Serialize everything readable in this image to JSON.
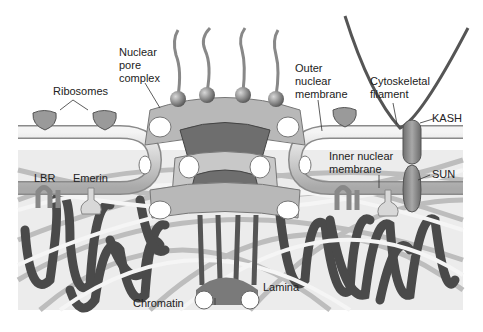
{
  "diagram": {
    "labels": {
      "ribosomes": "Ribosomes",
      "nuclear_pore_complex_1": "Nuclear",
      "nuclear_pore_complex_2": "pore",
      "nuclear_pore_complex_3": "complex",
      "outer_membrane_1": "Outer",
      "outer_membrane_2": "nuclear",
      "outer_membrane_3": "membrane",
      "cytoskeletal_1": "Cytoskeletal",
      "cytoskeletal_2": "filament",
      "kash": "KASH",
      "sun": "SUN",
      "inner_membrane_1": "Inner nuclear",
      "inner_membrane_2": "membrane",
      "lbr": "LBR",
      "emerin": "Emerin",
      "chromatin": "Chromatin",
      "lamina": "Lamina"
    },
    "colors": {
      "membrane": "#d4d4d4",
      "membrane_edge": "#8a8a8a",
      "chromatin": "#4a4a4a",
      "protein": "#8c8c8c",
      "pore": "#b8b8b8",
      "pore_dark": "#6e6e6e",
      "lamina_fiber": "#f2f2f2"
    }
  }
}
